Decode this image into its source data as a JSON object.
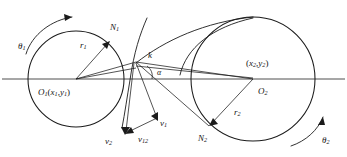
{
  "figure": {
    "type": "geometric-diagram",
    "background_color": "#ffffff",
    "stroke_color": "#1b1b1b",
    "axis_color": "#3a3a3a"
  },
  "labels": {
    "theta1": "θ",
    "theta1_sub": "1",
    "theta2": "θ",
    "theta2_sub": "2",
    "r1": "r",
    "r1_sub": "1",
    "r2": "r",
    "r2_sub": "2",
    "n1": "N",
    "n1_sub": "1",
    "n2": "N",
    "n2_sub": "2",
    "k": "k",
    "alpha": "α",
    "o1": "O",
    "o1_sub": "1",
    "o1_coords_open": "(",
    "o1_x": "x",
    "o1_x_sub": "1",
    "o1_comma": ",",
    "o1_y": "y",
    "o1_y_sub": "1",
    "o1_coords_close": ")",
    "o2": "O",
    "o2_sub": "2",
    "o2_coords_open": "(",
    "o2_x": "x",
    "o2_x_sub": "2",
    "o2_comma": ",",
    "o2_y": "y",
    "o2_y_sub": "2",
    "o2_coords_close": ")",
    "v1": "v",
    "v1_sub": "1",
    "v2": "v",
    "v2_sub": "2",
    "v12": "v",
    "v12_sub": "12"
  },
  "geometry": {
    "circle1": {
      "cx": 76,
      "cy": 79,
      "r": 48
    },
    "circle2": {
      "cx": 253,
      "cy": 79,
      "r": 62
    },
    "contact_point": {
      "x": 136,
      "y": 62
    },
    "n1_point": {
      "x": 109,
      "y": 41
    },
    "n2_point": {
      "x": 209,
      "y": 126
    },
    "axis_y": 79,
    "axis_x_start": 2,
    "axis_x_end": 345
  }
}
